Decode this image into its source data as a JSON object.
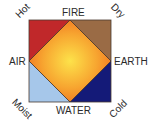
{
  "diagram": {
    "elements": {
      "top": "FIRE",
      "bottom": "WATER",
      "left": "AIR",
      "right": "EARTH"
    },
    "qualities": {
      "top_left": "Hot",
      "top_right": "Dry",
      "bottom_left": "Moist",
      "bottom_right": "Cold"
    },
    "colors": {
      "hot_corner": "#c0282a",
      "dry_corner": "#9a6b45",
      "moist_corner": "#a6c7ea",
      "cold_corner": "#141a78",
      "center_inner": "#fde24a",
      "center_outer": "#f07a1e",
      "outline": "#3a2a20"
    }
  }
}
